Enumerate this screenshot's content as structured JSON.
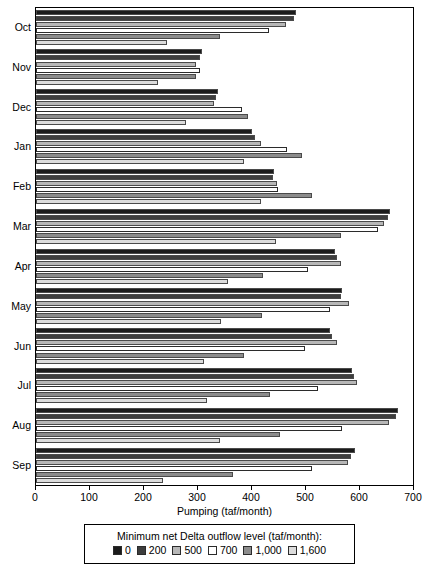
{
  "chart_data": {
    "type": "bar",
    "orientation": "horizontal",
    "title": "",
    "xlabel": "Pumping (taf/month)",
    "ylabel": "",
    "xlim": [
      0,
      700
    ],
    "xticks": [
      0,
      100,
      200,
      300,
      400,
      500,
      600,
      700
    ],
    "xticklabels": [
      "0",
      "100",
      "200",
      "300",
      "400",
      "500",
      "600",
      "700"
    ],
    "grid": false,
    "legend_title": "Minimum net Delta outflow level (taf/month):",
    "legend_position": "below",
    "categories": [
      "Oct",
      "Nov",
      "Dec",
      "Jan",
      "Feb",
      "Mar",
      "Apr",
      "May",
      "Jun",
      "Jul",
      "Aug",
      "Sep"
    ],
    "series": [
      {
        "name": "0",
        "color": "#1b1b1b",
        "values": [
          482,
          307,
          337,
          400,
          440,
          655,
          554,
          567,
          545,
          586,
          670,
          590
        ]
      },
      {
        "name": "200",
        "color": "#3d3d3d",
        "values": [
          477,
          303,
          334,
          406,
          438,
          651,
          558,
          565,
          549,
          588,
          666,
          584
        ]
      },
      {
        "name": "500",
        "color": "#b7b7b7",
        "values": [
          463,
          297,
          330,
          417,
          447,
          644,
          565,
          580,
          558,
          594,
          654,
          577
        ]
      },
      {
        "name": "700",
        "color": "#ffffff",
        "values": [
          432,
          303,
          382,
          465,
          449,
          633,
          503,
          545,
          498,
          522,
          567,
          512
        ]
      },
      {
        "name": "1,000",
        "color": "#8c8c8c",
        "values": [
          341,
          297,
          393,
          492,
          512,
          564,
          420,
          418,
          385,
          434,
          452,
          365
        ]
      },
      {
        "name": "1,600",
        "color": "#dcdcdc",
        "values": [
          243,
          226,
          278,
          386,
          417,
          444,
          356,
          343,
          311,
          316,
          341,
          235
        ]
      }
    ]
  }
}
